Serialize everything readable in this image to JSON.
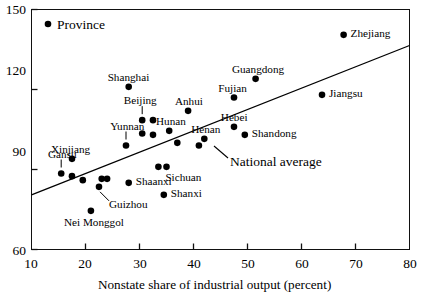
{
  "chart_data": {
    "type": "scatter",
    "title": "",
    "xlabel": "Nonstate share of industrial output (percent)",
    "ylabel": "",
    "xlim": [
      10,
      80
    ],
    "ylim": [
      60,
      150
    ],
    "xticks": [
      10,
      20,
      30,
      40,
      50,
      60,
      70,
      80
    ],
    "xticklabels": [
      "10",
      "20",
      "30",
      "40",
      "50",
      "60",
      "70",
      "80"
    ],
    "yticks": [
      60,
      90,
      120,
      150
    ],
    "yticklabels": [
      "60",
      "90",
      "120",
      "150"
    ],
    "grid": false,
    "legend": {
      "position": "top-left-inside",
      "entries": [
        {
          "marker": "filled-circle",
          "label": "Province"
        }
      ]
    },
    "annotations": [
      {
        "name": "national-average",
        "label": "National average",
        "type": "trendline-callout"
      }
    ],
    "series": [
      {
        "name": "Province",
        "marker": "filled-circle",
        "color": "#000000",
        "points": [
          {
            "label": "Zhejiang",
            "x": 67.8,
            "y": 140.5,
            "label_pos": "right"
          },
          {
            "label": "Guangdong",
            "x": 51.5,
            "y": 124.0,
            "label_pos": "above"
          },
          {
            "label": "Jiangsu",
            "x": 63.8,
            "y": 118.0,
            "label_pos": "right"
          },
          {
            "label": "Fujian",
            "x": 47.5,
            "y": 117.0,
            "label_pos": "above"
          },
          {
            "label": "Shanghai",
            "x": 28.0,
            "y": 121.0,
            "label_pos": "above"
          },
          {
            "label": "Anhui",
            "x": 39.0,
            "y": 112.0,
            "label_pos": "above"
          },
          {
            "label": "Beijing",
            "x": 30.5,
            "y": 108.5,
            "label_pos": "leader-above"
          },
          {
            "label": "",
            "x": 32.5,
            "y": 108.5,
            "label_pos": "none"
          },
          {
            "label": "Hunan",
            "x": 35.5,
            "y": 104.5,
            "label_pos": "above"
          },
          {
            "label": "Hebei",
            "x": 47.5,
            "y": 106.0,
            "label_pos": "above"
          },
          {
            "label": "Shandong",
            "x": 49.5,
            "y": 103.0,
            "label_pos": "right"
          },
          {
            "label": "Yunnan",
            "x": 27.5,
            "y": 99.0,
            "label_pos": "leader-above"
          },
          {
            "label": "Henan",
            "x": 42.0,
            "y": 101.5,
            "label_pos": "above"
          },
          {
            "label": "",
            "x": 30.5,
            "y": 103.5,
            "label_pos": "none"
          },
          {
            "label": "",
            "x": 32.5,
            "y": 103.0,
            "label_pos": "none"
          },
          {
            "label": "",
            "x": 37.0,
            "y": 100.0,
            "label_pos": "none"
          },
          {
            "label": "",
            "x": 41.0,
            "y": 99.0,
            "label_pos": "none"
          },
          {
            "label": "Xinjiang",
            "x": 17.5,
            "y": 94.0,
            "label_pos": "above"
          },
          {
            "label": "Sichuan",
            "x": 33.5,
            "y": 91.0,
            "label_pos": "below-right"
          },
          {
            "label": "",
            "x": 35.0,
            "y": 91.0,
            "label_pos": "none"
          },
          {
            "label": "Gansu",
            "x": 15.5,
            "y": 88.5,
            "label_pos": "leader-above"
          },
          {
            "label": "",
            "x": 17.5,
            "y": 87.5,
            "label_pos": "none"
          },
          {
            "label": "",
            "x": 19.5,
            "y": 86.0,
            "label_pos": "none"
          },
          {
            "label": "",
            "x": 23.0,
            "y": 86.5,
            "label_pos": "none"
          },
          {
            "label": "",
            "x": 24.0,
            "y": 86.5,
            "label_pos": "none"
          },
          {
            "label": "Shaanxi",
            "x": 28.0,
            "y": 85.0,
            "label_pos": "right"
          },
          {
            "label": "Guizhou",
            "x": 22.5,
            "y": 83.5,
            "label_pos": "leader-below"
          },
          {
            "label": "Shanxi",
            "x": 34.5,
            "y": 80.5,
            "label_pos": "right"
          },
          {
            "label": "Nei Monggol",
            "x": 21.0,
            "y": 74.5,
            "label_pos": "below"
          }
        ]
      }
    ],
    "trendline": {
      "name": "National average",
      "x_start": 10,
      "y_start": 80.5,
      "x_end": 80,
      "y_end": 136.5,
      "color": "#000000"
    }
  },
  "axis": {
    "x_title": "Nonstate share of industrial output (percent)"
  },
  "legend_text": {
    "province": "Province"
  },
  "annotation_text": {
    "national_average": "National average"
  }
}
